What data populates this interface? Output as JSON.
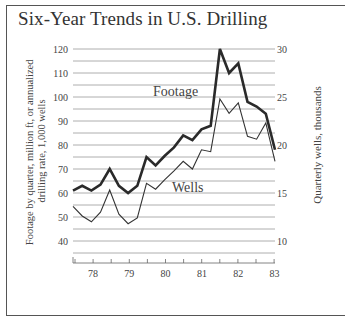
{
  "title": "Six-Year Trends in U.S. Drilling",
  "footer_text": "",
  "chart_data": {
    "type": "line",
    "title": "Six-Year Trends in U.S. Drilling",
    "xlabel": "",
    "ylabel": "Footage by quarter, million ft, or annualized drilling rate, 1,000 wells",
    "ylabel_right": "Quarterly wells, thousands",
    "ylim": [
      30,
      120
    ],
    "ylim_right": [
      7.5,
      30
    ],
    "y_ticks": [
      40,
      50,
      60,
      70,
      80,
      90,
      100,
      110,
      120
    ],
    "y_ticks_right": [
      10,
      15,
      20,
      25,
      30
    ],
    "x_tick_labels": [
      "78",
      "79",
      "80",
      "81",
      "82",
      "83"
    ],
    "grid": true,
    "legend_position": "inline labels",
    "x": [
      "77Q4",
      "78Q1",
      "78Q2",
      "78Q3",
      "78Q4",
      "79Q1",
      "79Q2",
      "79Q3",
      "79Q4",
      "80Q1",
      "80Q2",
      "80Q3",
      "80Q4",
      "81Q1",
      "81Q2",
      "81Q3",
      "81Q4",
      "82Q1",
      "82Q2",
      "82Q3",
      "82Q4",
      "83Q1",
      "83Q1b"
    ],
    "series": [
      {
        "name": "Footage",
        "axis": "left",
        "values": [
          61,
          63,
          61,
          63.5,
          70,
          63,
          60,
          63,
          75,
          71.5,
          75.5,
          79,
          84,
          82,
          86.5,
          88,
          120,
          110,
          114,
          98,
          96,
          93,
          78
        ]
      },
      {
        "name": "Wells",
        "axis": "right",
        "values": [
          13.6,
          12.6,
          12.0,
          13.0,
          15.3,
          12.8,
          11.8,
          12.4,
          16.0,
          15.4,
          16.4,
          17.3,
          18.3,
          17.5,
          19.5,
          19.3,
          24.8,
          23.3,
          24.4,
          20.9,
          20.6,
          22.3,
          18.3
        ]
      }
    ]
  }
}
